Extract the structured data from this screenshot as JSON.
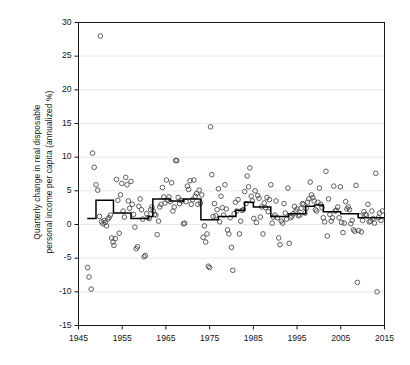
{
  "chart_data": {
    "type": "scatter",
    "title": "",
    "subtitle": "",
    "xlabel": "",
    "ylabel": "Quarterly change in real disposable personal income per capita (annualized %)",
    "ylabel_lines": [
      "Quarterly change in real disposable",
      "personal income per capita (annualized %)"
    ],
    "xlim": [
      1945,
      2015
    ],
    "ylim": [
      -15,
      30
    ],
    "xticks": [
      1945,
      1955,
      1965,
      1975,
      1985,
      1995,
      2005,
      2015
    ],
    "xticklabels": [
      "1945",
      "1955",
      "1965",
      "1975",
      "1985",
      "1995",
      "2005",
      "2015"
    ],
    "yticks": [
      -15,
      -10,
      -5,
      0,
      5,
      10,
      15,
      20,
      25,
      30
    ],
    "yticklabels": [
      "-15",
      "-10",
      "-5",
      "0",
      "5",
      "10",
      "15",
      "20",
      "25",
      "30"
    ],
    "grid": {
      "horizontal": true,
      "vertical": false,
      "color": "#e8e8e8"
    },
    "legend": {
      "show": false,
      "position": "none"
    },
    "frame": {
      "color": "#1a1a1a",
      "width": 1
    },
    "marker": {
      "shape": "open-circle",
      "radius": 2.3,
      "stroke": "#4d4d4d",
      "fill": "none"
    },
    "series": [
      {
        "name": "Quarterly change in real disposable personal income per capita",
        "type": "scatter",
        "points": [
          [
            1947.1,
            -6.4
          ],
          [
            1947.4,
            -7.8
          ],
          [
            1947.9,
            -9.6
          ],
          [
            1948.2,
            10.6
          ],
          [
            1948.6,
            8.5
          ],
          [
            1949.0,
            5.9
          ],
          [
            1949.4,
            5.1
          ],
          [
            1949.8,
            1.2
          ],
          [
            1950.0,
            28.0
          ],
          [
            1950.3,
            0.4
          ],
          [
            1950.6,
            0.1
          ],
          [
            1950.9,
            0.6
          ],
          [
            1951.1,
            0.3
          ],
          [
            1951.4,
            -0.2
          ],
          [
            1951.7,
            0.8
          ],
          [
            1952.0,
            1.0
          ],
          [
            1952.3,
            1.4
          ],
          [
            1952.6,
            -2.0
          ],
          [
            1952.9,
            -2.6
          ],
          [
            1953.1,
            -3.1
          ],
          [
            1953.4,
            -2.1
          ],
          [
            1953.7,
            6.7
          ],
          [
            1954.0,
            3.6
          ],
          [
            1954.3,
            -1.3
          ],
          [
            1954.6,
            4.4
          ],
          [
            1954.9,
            6.1
          ],
          [
            1955.2,
            2.0
          ],
          [
            1955.5,
            1.1
          ],
          [
            1955.8,
            7.0
          ],
          [
            1956.1,
            5.9
          ],
          [
            1956.4,
            3.5
          ],
          [
            1956.7,
            2.4
          ],
          [
            1957.0,
            6.4
          ],
          [
            1957.3,
            3.0
          ],
          [
            1957.6,
            1.5
          ],
          [
            1957.9,
            -0.4
          ],
          [
            1958.2,
            -3.6
          ],
          [
            1958.5,
            -3.3
          ],
          [
            1958.8,
            2.7
          ],
          [
            1959.1,
            3.8
          ],
          [
            1959.4,
            2.2
          ],
          [
            1959.7,
            0.8
          ],
          [
            1960.0,
            -4.8
          ],
          [
            1960.3,
            -4.6
          ],
          [
            1960.6,
            1.6
          ],
          [
            1960.9,
            1.0
          ],
          [
            1961.2,
            0.9
          ],
          [
            1961.5,
            2.2
          ],
          [
            1961.8,
            2.6
          ],
          [
            1962.1,
            2.0
          ],
          [
            1962.4,
            1.5
          ],
          [
            1962.7,
            1.4
          ],
          [
            1963.0,
            -1.5
          ],
          [
            1963.3,
            0.5
          ],
          [
            1963.6,
            2.6
          ],
          [
            1963.9,
            3.0
          ],
          [
            1964.2,
            5.5
          ],
          [
            1964.5,
            4.1
          ],
          [
            1964.8,
            3.2
          ],
          [
            1965.1,
            6.6
          ],
          [
            1965.4,
            3.6
          ],
          [
            1965.7,
            4.1
          ],
          [
            1966.0,
            3.4
          ],
          [
            1966.3,
            6.2
          ],
          [
            1966.6,
            2.0
          ],
          [
            1966.9,
            2.6
          ],
          [
            1967.2,
            9.5
          ],
          [
            1967.5,
            9.5
          ],
          [
            1967.8,
            4.0
          ],
          [
            1968.1,
            3.1
          ],
          [
            1968.4,
            3.6
          ],
          [
            1968.7,
            3.5
          ],
          [
            1969.0,
            0.1
          ],
          [
            1969.3,
            0.2
          ],
          [
            1969.6,
            3.4
          ],
          [
            1969.9,
            5.7
          ],
          [
            1970.2,
            5.2
          ],
          [
            1970.5,
            6.5
          ],
          [
            1970.8,
            3.0
          ],
          [
            1971.1,
            3.7
          ],
          [
            1971.4,
            6.6
          ],
          [
            1971.7,
            4.2
          ],
          [
            1972.0,
            4.6
          ],
          [
            1972.3,
            3.0
          ],
          [
            1972.6,
            5.1
          ],
          [
            1972.9,
            3.2
          ],
          [
            1973.2,
            4.4
          ],
          [
            1973.5,
            -1.9
          ],
          [
            1973.8,
            -0.2
          ],
          [
            1974.1,
            -2.6
          ],
          [
            1974.4,
            -1.4
          ],
          [
            1974.7,
            -6.2
          ],
          [
            1975.0,
            -6.4
          ],
          [
            1975.2,
            14.5
          ],
          [
            1975.5,
            7.4
          ],
          [
            1975.8,
            1.2
          ],
          [
            1976.1,
            3.1
          ],
          [
            1976.4,
            1.3
          ],
          [
            1976.7,
            2.2
          ],
          [
            1977.0,
            5.3
          ],
          [
            1977.3,
            0.4
          ],
          [
            1977.6,
            4.2
          ],
          [
            1977.9,
            2.5
          ],
          [
            1978.2,
            1.4
          ],
          [
            1978.5,
            5.9
          ],
          [
            1978.8,
            2.3
          ],
          [
            1979.1,
            -0.8
          ],
          [
            1979.4,
            -1.4
          ],
          [
            1979.7,
            1.0
          ],
          [
            1980.0,
            -3.4
          ],
          [
            1980.3,
            -6.8
          ],
          [
            1980.6,
            1.6
          ],
          [
            1980.9,
            3.3
          ],
          [
            1981.2,
            2.0
          ],
          [
            1981.5,
            3.7
          ],
          [
            1981.8,
            -1.4
          ],
          [
            1982.1,
            0.5
          ],
          [
            1982.4,
            2.1
          ],
          [
            1982.7,
            2.2
          ],
          [
            1983.0,
            4.9
          ],
          [
            1983.3,
            3.1
          ],
          [
            1983.6,
            7.2
          ],
          [
            1983.9,
            5.6
          ],
          [
            1984.2,
            8.4
          ],
          [
            1984.5,
            4.2
          ],
          [
            1984.8,
            3.5
          ],
          [
            1985.1,
            0.9
          ],
          [
            1985.4,
            5.0
          ],
          [
            1985.7,
            0.3
          ],
          [
            1986.0,
            4.3
          ],
          [
            1986.3,
            3.9
          ],
          [
            1986.6,
            1.1
          ],
          [
            1986.9,
            2.6
          ],
          [
            1987.2,
            -1.4
          ],
          [
            1987.5,
            3.2
          ],
          [
            1987.8,
            2.5
          ],
          [
            1988.1,
            4.0
          ],
          [
            1988.4,
            1.9
          ],
          [
            1988.7,
            3.7
          ],
          [
            1989.0,
            5.9
          ],
          [
            1989.3,
            0.2
          ],
          [
            1989.6,
            1.1
          ],
          [
            1989.9,
            1.4
          ],
          [
            1990.2,
            3.5
          ],
          [
            1990.5,
            1.0
          ],
          [
            1990.8,
            -2.0
          ],
          [
            1991.1,
            -3.0
          ],
          [
            1991.4,
            0.5
          ],
          [
            1991.7,
            0.2
          ],
          [
            1992.0,
            3.1
          ],
          [
            1992.3,
            1.7
          ],
          [
            1992.6,
            0.8
          ],
          [
            1992.9,
            5.4
          ],
          [
            1993.2,
            -2.8
          ],
          [
            1993.5,
            1.0
          ],
          [
            1993.8,
            1.2
          ],
          [
            1994.1,
            1.6
          ],
          [
            1994.4,
            2.7
          ],
          [
            1994.7,
            2.0
          ],
          [
            1995.0,
            2.3
          ],
          [
            1995.3,
            1.3
          ],
          [
            1995.6,
            1.4
          ],
          [
            1995.9,
            2.4
          ],
          [
            1996.2,
            3.1
          ],
          [
            1996.5,
            3.0
          ],
          [
            1996.8,
            1.7
          ],
          [
            1997.1,
            2.4
          ],
          [
            1997.4,
            3.3
          ],
          [
            1997.7,
            3.8
          ],
          [
            1998.0,
            6.3
          ],
          [
            1998.3,
            4.4
          ],
          [
            1998.6,
            4.0
          ],
          [
            1998.9,
            3.5
          ],
          [
            1999.2,
            2.2
          ],
          [
            1999.5,
            2.0
          ],
          [
            1999.8,
            3.3
          ],
          [
            2000.1,
            5.4
          ],
          [
            2000.4,
            3.0
          ],
          [
            2000.7,
            2.5
          ],
          [
            2001.0,
            1.0
          ],
          [
            2001.3,
            0.4
          ],
          [
            2001.6,
            7.9
          ],
          [
            2001.9,
            -1.7
          ],
          [
            2002.2,
            3.8
          ],
          [
            2002.5,
            1.5
          ],
          [
            2002.8,
            0.5
          ],
          [
            2003.1,
            1.0
          ],
          [
            2003.4,
            5.7
          ],
          [
            2003.7,
            2.0
          ],
          [
            2004.0,
            2.1
          ],
          [
            2004.3,
            2.6
          ],
          [
            2004.6,
            1.0
          ],
          [
            2004.9,
            5.6
          ],
          [
            2005.2,
            0.3
          ],
          [
            2005.5,
            -1.2
          ],
          [
            2005.8,
            0.2
          ],
          [
            2006.1,
            3.4
          ],
          [
            2006.4,
            2.3
          ],
          [
            2006.7,
            2.6
          ],
          [
            2007.0,
            2.2
          ],
          [
            2007.3,
            0.1
          ],
          [
            2007.6,
            0.6
          ],
          [
            2007.9,
            -0.8
          ],
          [
            2008.2,
            -1.0
          ],
          [
            2008.5,
            5.8
          ],
          [
            2008.8,
            -8.6
          ],
          [
            2009.1,
            -0.9
          ],
          [
            2009.4,
            1.3
          ],
          [
            2009.7,
            -1.1
          ],
          [
            2010.0,
            0.6
          ],
          [
            2010.3,
            1.9
          ],
          [
            2010.6,
            1.5
          ],
          [
            2010.9,
            1.4
          ],
          [
            2011.2,
            3.0
          ],
          [
            2011.5,
            0.4
          ],
          [
            2011.8,
            0.5
          ],
          [
            2012.1,
            2.0
          ],
          [
            2012.4,
            0.9
          ],
          [
            2012.7,
            0.2
          ],
          [
            2013.0,
            7.6
          ],
          [
            2013.3,
            -10.0
          ],
          [
            2013.6,
            1.0
          ],
          [
            2013.9,
            1.7
          ],
          [
            2014.2,
            0.6
          ],
          [
            2014.5,
            2.0
          ]
        ]
      },
      {
        "name": "Presidential-term average (step)",
        "type": "step",
        "color": "#000000",
        "width": 1.5,
        "steps": [
          [
            1947.0,
            0.9
          ],
          [
            1949.0,
            0.9
          ],
          [
            1949.0,
            3.6
          ],
          [
            1953.0,
            3.6
          ],
          [
            1953.0,
            1.7
          ],
          [
            1957.0,
            1.7
          ],
          [
            1957.0,
            0.9
          ],
          [
            1961.0,
            0.9
          ],
          [
            1961.0,
            1.2
          ],
          [
            1962.0,
            1.2
          ],
          [
            1962.0,
            3.8
          ],
          [
            1966.0,
            3.8
          ],
          [
            1966.0,
            3.5
          ],
          [
            1969.0,
            3.5
          ],
          [
            1969.0,
            3.8
          ],
          [
            1973.0,
            3.8
          ],
          [
            1973.0,
            0.7
          ],
          [
            1977.0,
            0.7
          ],
          [
            1977.0,
            1.2
          ],
          [
            1981.0,
            1.2
          ],
          [
            1981.0,
            2.1
          ],
          [
            1983.0,
            2.1
          ],
          [
            1983.0,
            3.3
          ],
          [
            1985.0,
            3.3
          ],
          [
            1985.0,
            2.6
          ],
          [
            1989.0,
            2.6
          ],
          [
            1989.0,
            1.2
          ],
          [
            1993.0,
            1.2
          ],
          [
            1993.0,
            1.6
          ],
          [
            1997.0,
            1.6
          ],
          [
            1997.0,
            2.7
          ],
          [
            1999.0,
            2.7
          ],
          [
            1999.0,
            2.9
          ],
          [
            2001.0,
            2.9
          ],
          [
            2001.0,
            1.9
          ],
          [
            2005.0,
            1.9
          ],
          [
            2005.0,
            1.6
          ],
          [
            2009.0,
            1.6
          ],
          [
            2009.0,
            1.0
          ],
          [
            2015.0,
            1.0
          ]
        ]
      }
    ]
  }
}
